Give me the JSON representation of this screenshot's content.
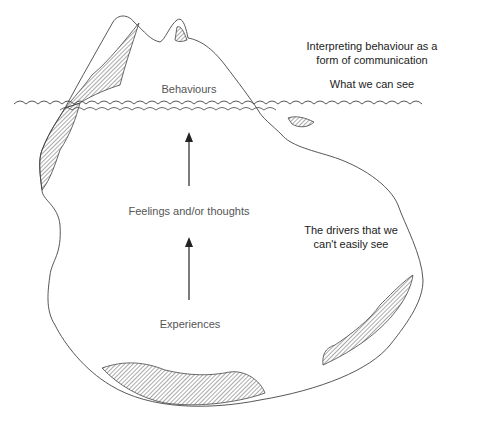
{
  "diagram": {
    "heading": "Interpreting behaviour as a form of communication",
    "heading_lines": [
      "Interpreting behaviour as a",
      "form of communication"
    ],
    "above_water_caption": "What we can see",
    "below_water_caption_lines": [
      "The drivers that we",
      "can't easily see"
    ],
    "nodes": {
      "behaviours": "Behaviours",
      "feelings": "Feelings and/or thoughts",
      "experiences": "Experiences"
    },
    "arrows": [
      {
        "from": "Experiences",
        "to": "Feelings and/or thoughts"
      },
      {
        "from": "Feelings and/or thoughts",
        "to": "Behaviours"
      }
    ],
    "colors": {
      "outline": "#444444",
      "hatch": "#555555",
      "label_text": "#555555",
      "caption_text": "#222222",
      "background": "#ffffff"
    }
  }
}
